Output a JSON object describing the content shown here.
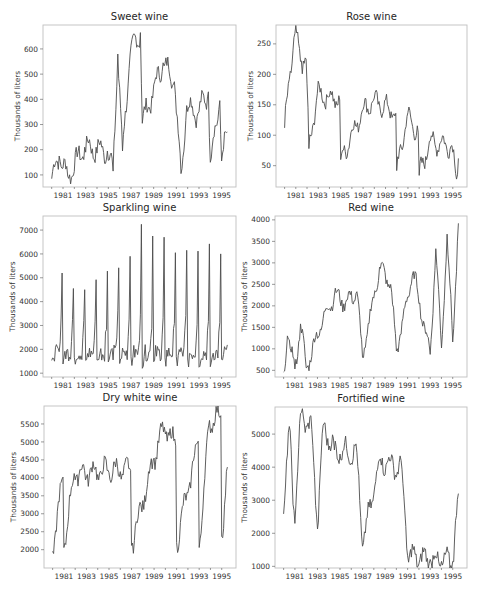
{
  "figure": {
    "ylabel": "Thousands of liters",
    "line_color": "#4d4d4d",
    "frame_color": "#bfbfbf"
  },
  "chart_data": [
    {
      "type": "line",
      "title": "Sweet wine",
      "xlabel": "",
      "ylabel": "Thousands of liters",
      "x_start": "1980-01",
      "x_end": "1995-07",
      "frequency": "monthly",
      "xticks": [
        "1981",
        "1983",
        "1985",
        "1987",
        "1989",
        "1991",
        "1993",
        "1995"
      ],
      "yticks": [
        100,
        200,
        300,
        400,
        500,
        600
      ],
      "ylim": [
        52,
        695
      ],
      "grid": false,
      "keypoints": [
        {
          "x": "1980-01",
          "y": 85
        },
        {
          "x": "1980-09",
          "y": 175
        },
        {
          "x": "1981-06",
          "y": 95
        },
        {
          "x": "1982-12",
          "y": 210
        },
        {
          "x": "1984-12",
          "y": 195
        },
        {
          "x": "1985-06",
          "y": 115
        },
        {
          "x": "1985-11",
          "y": 580
        },
        {
          "x": "1986-04",
          "y": 195
        },
        {
          "x": "1986-12",
          "y": 580
        },
        {
          "x": "1987-11",
          "y": 665
        },
        {
          "x": "1988-01",
          "y": 305
        },
        {
          "x": "1989-11",
          "y": 545
        },
        {
          "x": "1990-11",
          "y": 470
        },
        {
          "x": "1991-06",
          "y": 105
        },
        {
          "x": "1991-12",
          "y": 375
        },
        {
          "x": "1992-12",
          "y": 345
        },
        {
          "x": "1993-11",
          "y": 430
        },
        {
          "x": "1994-01",
          "y": 150
        },
        {
          "x": "1994-11",
          "y": 395
        },
        {
          "x": "1995-01",
          "y": 155
        },
        {
          "x": "1995-07",
          "y": 270
        }
      ]
    },
    {
      "type": "line",
      "title": "Rose wine",
      "xlabel": "",
      "ylabel": "Thousands of liters",
      "x_start": "1980-01",
      "x_end": "1995-07",
      "frequency": "monthly",
      "xticks": [
        "1981",
        "1983",
        "1985",
        "1987",
        "1989",
        "1991",
        "1993",
        "1995"
      ],
      "yticks": [
        50,
        100,
        150,
        200,
        250
      ],
      "ylim": [
        15,
        281
      ],
      "grid": false,
      "keypoints": [
        {
          "x": "1980-01",
          "y": 112
        },
        {
          "x": "1980-07",
          "y": 205
        },
        {
          "x": "1980-12",
          "y": 267
        },
        {
          "x": "1981-07",
          "y": 222
        },
        {
          "x": "1981-12",
          "y": 225
        },
        {
          "x": "1982-03",
          "y": 78
        },
        {
          "x": "1982-12",
          "y": 168
        },
        {
          "x": "1983-12",
          "y": 163
        },
        {
          "x": "1984-12",
          "y": 158
        },
        {
          "x": "1985-01",
          "y": 60
        },
        {
          "x": "1986-12",
          "y": 140
        },
        {
          "x": "1987-12",
          "y": 157
        },
        {
          "x": "1989-12",
          "y": 136
        },
        {
          "x": "1990-01",
          "y": 42
        },
        {
          "x": "1990-12",
          "y": 131
        },
        {
          "x": "1991-12",
          "y": 105
        },
        {
          "x": "1992-01",
          "y": 34
        },
        {
          "x": "1992-12",
          "y": 90
        },
        {
          "x": "1994-12",
          "y": 83
        },
        {
          "x": "1995-05",
          "y": 28
        },
        {
          "x": "1995-07",
          "y": 62
        }
      ]
    },
    {
      "type": "line",
      "title": "Sparkling wine",
      "xlabel": "",
      "ylabel": "Thousands of liters",
      "x_start": "1980-01",
      "x_end": "1995-07",
      "frequency": "monthly",
      "xticks": [
        "1981",
        "1983",
        "1985",
        "1987",
        "1989",
        "1991",
        "1993",
        "1995"
      ],
      "yticks": [
        1000,
        2000,
        3000,
        4000,
        5000,
        6000,
        7000
      ],
      "ylim": [
        840,
        7590
      ],
      "grid": false,
      "december_peaks": {
        "1980": 5200,
        "1981": 4550,
        "1982": 4500,
        "1983": 4920,
        "1984": 5280,
        "1985": 5420,
        "1986": 5900,
        "1987": 7240,
        "1988": 6750,
        "1989": 6700,
        "1990": 6050,
        "1991": 6150,
        "1992": 6120,
        "1993": 6420,
        "1994": 6000
      },
      "baseline_range": [
        1050,
        2500
      ]
    },
    {
      "type": "line",
      "title": "Red wine",
      "xlabel": "",
      "ylabel": "Thousands of liters",
      "x_start": "1980-01",
      "x_end": "1995-07",
      "frequency": "monthly",
      "xticks": [
        "1981",
        "1983",
        "1985",
        "1987",
        "1989",
        "1991",
        "1993",
        "1995"
      ],
      "yticks": [
        500,
        1000,
        1500,
        2000,
        2500,
        3000,
        3500,
        4000
      ],
      "ylim": [
        345,
        4090
      ],
      "grid": false,
      "keypoints": [
        {
          "x": "1980-01",
          "y": 464
        },
        {
          "x": "1980-05",
          "y": 1300
        },
        {
          "x": "1981-01",
          "y": 530
        },
        {
          "x": "1981-07",
          "y": 1580
        },
        {
          "x": "1982-01",
          "y": 560
        },
        {
          "x": "1983-07",
          "y": 1700
        },
        {
          "x": "1984-07",
          "y": 2250
        },
        {
          "x": "1985-07",
          "y": 2080
        },
        {
          "x": "1986-07",
          "y": 2330
        },
        {
          "x": "1987-01",
          "y": 800
        },
        {
          "x": "1988-07",
          "y": 2900
        },
        {
          "x": "1989-07",
          "y": 2500
        },
        {
          "x": "1990-01",
          "y": 950
        },
        {
          "x": "1991-07",
          "y": 2800
        },
        {
          "x": "1993-01",
          "y": 870
        },
        {
          "x": "1993-07",
          "y": 3330
        },
        {
          "x": "1994-01",
          "y": 1020
        },
        {
          "x": "1994-07",
          "y": 3670
        },
        {
          "x": "1995-01",
          "y": 1160
        },
        {
          "x": "1995-07",
          "y": 3920
        }
      ]
    },
    {
      "type": "line",
      "title": "Dry white wine",
      "xlabel": "",
      "ylabel": "Thousands of liters",
      "x_start": "1980-01",
      "x_end": "1995-07",
      "frequency": "monthly",
      "xticks": [
        "1981",
        "1983",
        "1985",
        "1987",
        "1989",
        "1991",
        "1993",
        "1995"
      ],
      "yticks": [
        2000,
        2500,
        3000,
        3500,
        4000,
        4500,
        5000,
        5500
      ],
      "ylim": [
        1490,
        6000
      ],
      "grid": false,
      "keypoints": [
        {
          "x": "1980-01",
          "y": 1954
        },
        {
          "x": "1980-12",
          "y": 4020
        },
        {
          "x": "1981-01",
          "y": 2060
        },
        {
          "x": "1981-12",
          "y": 4120
        },
        {
          "x": "1984-12",
          "y": 4210
        },
        {
          "x": "1986-12",
          "y": 4210
        },
        {
          "x": "1987-01",
          "y": 2120
        },
        {
          "x": "1988-12",
          "y": 4500
        },
        {
          "x": "1989-12",
          "y": 5410
        },
        {
          "x": "1990-12",
          "y": 4890
        },
        {
          "x": "1991-01",
          "y": 2200
        },
        {
          "x": "1992-12",
          "y": 5020
        },
        {
          "x": "1993-01",
          "y": 2060
        },
        {
          "x": "1993-12",
          "y": 5600
        },
        {
          "x": "1994-12",
          "y": 5730
        },
        {
          "x": "1995-01",
          "y": 2370
        },
        {
          "x": "1995-07",
          "y": 4300
        }
      ]
    },
    {
      "type": "line",
      "title": "Fortified wine",
      "xlabel": "",
      "ylabel": "Thousands of liters",
      "x_start": "1980-01",
      "x_end": "1995-07",
      "frequency": "monthly",
      "xticks": [
        "1981",
        "1983",
        "1985",
        "1987",
        "1989",
        "1991",
        "1993",
        "1995"
      ],
      "yticks": [
        1000,
        2000,
        3000,
        4000,
        5000
      ],
      "ylim": [
        950,
        5820
      ],
      "grid": false,
      "keypoints": [
        {
          "x": "1980-01",
          "y": 2585
        },
        {
          "x": "1980-07",
          "y": 5230
        },
        {
          "x": "1981-01",
          "y": 2300
        },
        {
          "x": "1981-07",
          "y": 5620
        },
        {
          "x": "1982-07",
          "y": 5140
        },
        {
          "x": "1983-01",
          "y": 2130
        },
        {
          "x": "1983-07",
          "y": 5260
        },
        {
          "x": "1984-07",
          "y": 4520
        },
        {
          "x": "1986-07",
          "y": 4440
        },
        {
          "x": "1987-01",
          "y": 1610
        },
        {
          "x": "1988-07",
          "y": 4220
        },
        {
          "x": "1990-07",
          "y": 3940
        },
        {
          "x": "1991-01",
          "y": 1320
        },
        {
          "x": "1993-01",
          "y": 1210
        },
        {
          "x": "1994-01",
          "y": 1150
        },
        {
          "x": "1995-01",
          "y": 1150
        },
        {
          "x": "1995-07",
          "y": 3200
        }
      ]
    }
  ]
}
